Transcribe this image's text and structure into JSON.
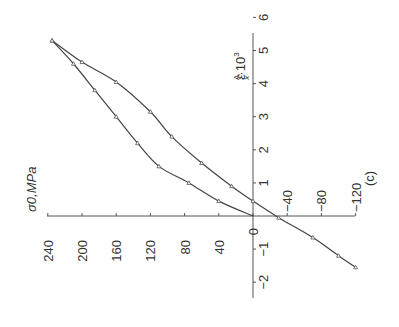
{
  "figure": {
    "panel_label": "(c)",
    "rotation_deg": -90
  },
  "chart_data": {
    "type": "line",
    "title": "",
    "panel": "(c)",
    "xlabel": "σ0, MPa",
    "ylabel": "εxA·10³",
    "x_axis": {
      "label": "σ0,MPa",
      "ticks": [
        240,
        200,
        160,
        120,
        80,
        40,
        0,
        -40,
        -80,
        -120
      ],
      "tick_labels": [
        "240",
        "200",
        "160",
        "120",
        "80",
        "40",
        "0",
        "−40",
        "−80",
        "−120"
      ],
      "range": [
        -120,
        240
      ]
    },
    "y_axis": {
      "label_main": "ε",
      "label_sup": "A",
      "label_sub": "x",
      "label_tail": "·10",
      "label_exp": "3",
      "ticks": [
        -2,
        -1,
        1,
        2,
        3,
        4,
        5,
        6
      ],
      "tick_labels": [
        "−2",
        "−1",
        "1",
        "2",
        "3",
        "4",
        "5",
        "6"
      ],
      "range": [
        -2,
        6
      ]
    },
    "grid": false,
    "legend": null,
    "orientation_note": "figure printed rotated 90° counter-clockwise",
    "series": [
      {
        "name": "loading",
        "points": [
          {
            "sigma": 0,
            "eps": 0.0
          },
          {
            "sigma": 40,
            "eps": 0.45
          },
          {
            "sigma": 75,
            "eps": 1.0
          },
          {
            "sigma": 110,
            "eps": 1.5
          },
          {
            "sigma": 135,
            "eps": 2.2
          },
          {
            "sigma": 160,
            "eps": 3.0
          },
          {
            "sigma": 185,
            "eps": 3.8
          },
          {
            "sigma": 210,
            "eps": 4.6
          },
          {
            "sigma": 235,
            "eps": 5.3
          }
        ]
      },
      {
        "name": "unloading",
        "points": [
          {
            "sigma": 235,
            "eps": 5.3
          },
          {
            "sigma": 200,
            "eps": 4.65
          },
          {
            "sigma": 160,
            "eps": 4.05
          },
          {
            "sigma": 120,
            "eps": 3.15
          },
          {
            "sigma": 95,
            "eps": 2.4
          },
          {
            "sigma": 60,
            "eps": 1.6
          },
          {
            "sigma": 25,
            "eps": 0.9
          },
          {
            "sigma": 0,
            "eps": 0.45
          },
          {
            "sigma": -30,
            "eps": -0.05
          },
          {
            "sigma": -70,
            "eps": -0.65
          },
          {
            "sigma": -100,
            "eps": -1.2
          },
          {
            "sigma": -120,
            "eps": -1.55
          }
        ]
      }
    ]
  }
}
